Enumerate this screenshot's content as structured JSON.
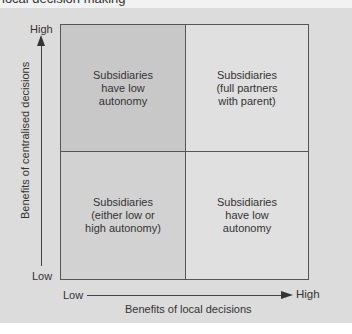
{
  "header": {
    "title": "local decision making"
  },
  "diagram": {
    "y_axis": {
      "title": "Benefits of centralised decisions",
      "high_label": "High",
      "low_label": "Low"
    },
    "x_axis": {
      "title": "Benefits of local decisions",
      "low_label": "Low",
      "high_label": "High"
    },
    "quadrants": {
      "top_left": {
        "lines": [
          "Subsidiaries",
          "have low",
          "autonomy"
        ]
      },
      "top_right": {
        "lines": [
          "Subsidiaries",
          "(full partners",
          "with parent)"
        ]
      },
      "bottom_left": {
        "lines": [
          "Subsidiaries",
          "(either low or",
          "high autonomy)"
        ]
      },
      "bottom_right": {
        "lines": [
          "Subsidiaries",
          "have low",
          "autonomy"
        ]
      }
    },
    "colors": {
      "panel_background": "#dcdcdc",
      "top_left_fill": "#c8c8c8",
      "top_right_fill": "#e0e0e0",
      "bottom_left_fill": "#d2d2d2",
      "bottom_right_fill": "#e0e0e0",
      "border": "#555555"
    }
  }
}
